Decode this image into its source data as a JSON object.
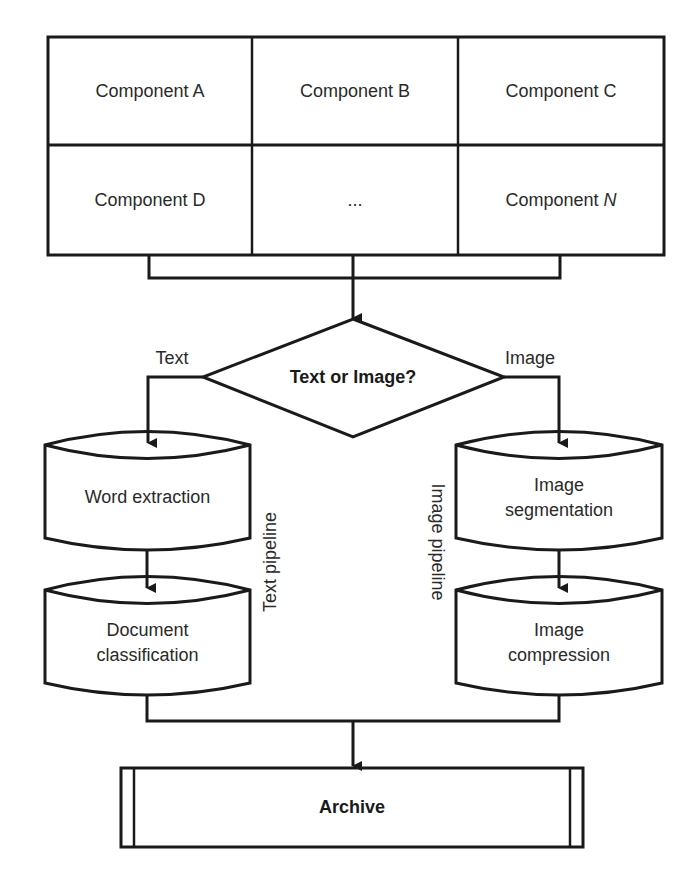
{
  "components": {
    "grid": [
      [
        "Component A",
        "Component B",
        "Component C"
      ],
      [
        "Component D",
        "...",
        "Component "
      ]
    ],
    "last_component_suffix": "N"
  },
  "decision": {
    "label": "Text or Image?",
    "left_branch_label": "Text",
    "right_branch_label": "Image"
  },
  "text_pipeline": {
    "label": "Text pipeline",
    "steps": [
      {
        "line1": "Word extraction",
        "line2": ""
      },
      {
        "line1": "Document",
        "line2": "classification"
      }
    ]
  },
  "image_pipeline": {
    "label": "Image pipeline",
    "steps": [
      {
        "line1": "Image",
        "line2": "segmentation"
      },
      {
        "line1": "Image",
        "line2": "compression"
      }
    ]
  },
  "archive": {
    "label": "Archive"
  },
  "colors": {
    "stroke": "#1a1a1a",
    "text": "#2a2a2a",
    "background": "#ffffff"
  }
}
